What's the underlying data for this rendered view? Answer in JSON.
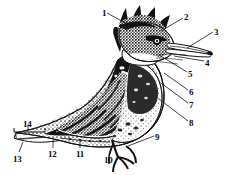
{
  "figure": {
    "style": "black-and-white stippled line engraving",
    "background_color": "#ffffff",
    "ink_color": "#111111",
    "width": 233,
    "height": 175
  },
  "labels": [
    {
      "id": "1",
      "text": "1",
      "x": 102,
      "y": 9,
      "target_x": 133,
      "target_y": 26
    },
    {
      "id": "2",
      "text": "2",
      "x": 184,
      "y": 13,
      "target_x": 160,
      "target_y": 30
    },
    {
      "id": "3",
      "text": "3",
      "x": 214,
      "y": 28,
      "target_x": 186,
      "target_y": 47
    },
    {
      "id": "4",
      "text": "4",
      "x": 205,
      "y": 59,
      "target_x": 172,
      "target_y": 55
    },
    {
      "id": "5",
      "text": "5",
      "x": 188,
      "y": 70,
      "target_x": 158,
      "target_y": 54
    },
    {
      "id": "6",
      "text": "6",
      "x": 189,
      "y": 88,
      "target_x": 163,
      "target_y": 72
    },
    {
      "id": "7",
      "text": "7",
      "x": 189,
      "y": 101,
      "target_x": 160,
      "target_y": 82
    },
    {
      "id": "8",
      "text": "8",
      "x": 189,
      "y": 119,
      "target_x": 158,
      "target_y": 98
    },
    {
      "id": "9",
      "text": "9",
      "x": 155,
      "y": 133,
      "target_x": 130,
      "target_y": 145
    },
    {
      "id": "10",
      "text": "10",
      "x": 104,
      "y": 156,
      "target_x": 112,
      "target_y": 144
    },
    {
      "id": "11",
      "text": "11",
      "x": 76,
      "y": 150,
      "target_x": 79,
      "target_y": 139
    },
    {
      "id": "12",
      "text": "12",
      "x": 48,
      "y": 150,
      "target_x": 52,
      "target_y": 140
    },
    {
      "id": "13",
      "text": "13",
      "x": 13,
      "y": 155,
      "target_x": 22,
      "target_y": 143
    },
    {
      "id": "14",
      "text": "14",
      "x": 23,
      "y": 123,
      "target_x": 28,
      "target_y": 133
    }
  ],
  "bracket": {
    "name": "tail-tip-bracket",
    "x1": 14,
    "x2": 45,
    "y": 132
  }
}
